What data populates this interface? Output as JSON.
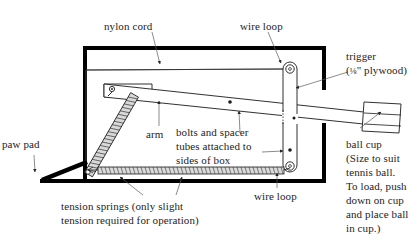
{
  "diagram": {
    "colors": {
      "ink": "#1a1a1a",
      "label_ink": "#242424",
      "box_outline": "#000000",
      "paper": "#ffffff",
      "spring_fill": "#b8b8b8",
      "thin_line": "#333333"
    }
  },
  "labels": {
    "nylon_cord": "nylon cord",
    "wire_loop_top": "wire loop",
    "trigger": "trigger\n(⅛\" plywood)",
    "trigger_line1": "trigger",
    "trigger_line2_pre": "(",
    "trigger_fraction": "⅛",
    "trigger_line2_post": "\" plywood)",
    "paw_pad": "paw pad",
    "arm": "arm",
    "bolts_spacer": "bolts and spacer\ntubes attached to\nsides of box",
    "bolts_spacer_line1": "bolts and spacer",
    "bolts_spacer_line2": "tubes attached to",
    "bolts_spacer_line3": "sides of box",
    "tension_springs": "tension springs (only slight\ntension required for operation)",
    "tension_springs_line1": "tension springs (only slight",
    "tension_springs_line2": "tension required for operation)",
    "wire_loop_bottom": "wire loop",
    "ball_cup": "ball cup\n(Size to suit\ntennis ball.\nTo load, push\ndown on cup\nand place ball\nin cup.)",
    "ball_cup_line1": "ball cup",
    "ball_cup_line2": "(Size to suit",
    "ball_cup_line3": "tennis ball.",
    "ball_cup_line4": "To load, push",
    "ball_cup_line5": "down on cup",
    "ball_cup_line6": "and place ball",
    "ball_cup_line7": "in cup.)"
  },
  "parts": {
    "box": "box-enclosure",
    "paw_pad": "paw-pad-lever",
    "arm": "throwing-arm",
    "ball_cup": "ball-cup",
    "trigger": "trigger-plywood",
    "nylon_cord": "nylon-cord",
    "wire_loop_top": "wire-loop-top",
    "wire_loop_bottom": "wire-loop-bottom",
    "diagonal_spring": "diagonal-tension-spring",
    "horizontal_spring": "horizontal-tension-spring",
    "pivot_bolt": "pivot-bolt",
    "spacer_bolt_mid": "spacer-bolt-middle",
    "spacer_bolt_right": "spacer-bolt-right"
  }
}
